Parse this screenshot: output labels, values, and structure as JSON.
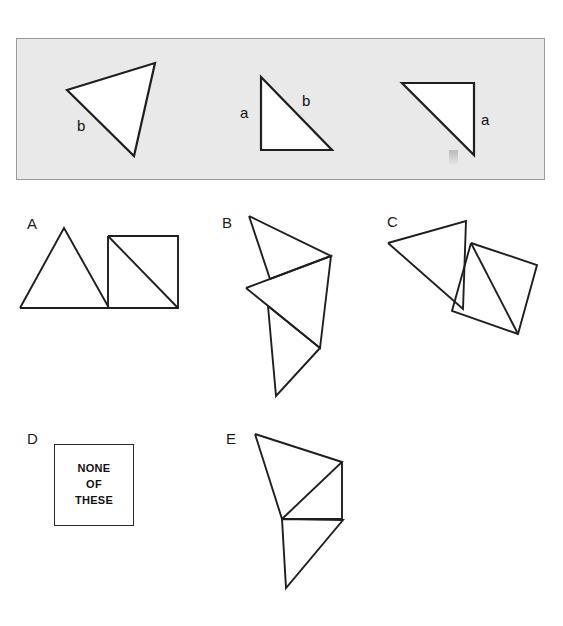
{
  "page": {
    "background_color": "#ffffff",
    "line_color": "#1f1f1f",
    "panel_fill": "#e9e9e9",
    "panel_border": "#9a9a9a"
  },
  "prompt_panel": {
    "name": "given-shapes-panel",
    "shapes": [
      {
        "name": "triangle-scalene-tilted",
        "points": "67,90 155,63 134,156",
        "labels": [
          {
            "text": "b",
            "x": 77,
            "y": 118
          }
        ]
      },
      {
        "name": "triangle-right-legs-left",
        "points": "261,77 261,150 332,150",
        "labels": [
          {
            "text": "a",
            "x": 240,
            "y": 105
          },
          {
            "text": "b",
            "x": 302,
            "y": 93
          }
        ]
      },
      {
        "name": "triangle-right-legs-top",
        "points": "402,83 474,83 474,155",
        "labels": [
          {
            "text": "a",
            "x": 481,
            "y": 112
          }
        ]
      }
    ]
  },
  "options": [
    {
      "id": "A",
      "label": "A",
      "label_x": 27,
      "label_y": 216,
      "name": "option-a",
      "polylines": [
        "20,308 64,228 109,308 20,308",
        "108,236 178,236 178,308 108,308 108,236",
        "108,236 178,308"
      ]
    },
    {
      "id": "B",
      "label": "B",
      "label_x": 222,
      "label_y": 215,
      "name": "option-b",
      "polylines": [
        "249,216 331,256 270,279 249,216",
        "246,288 331,256 320,348 246,288",
        "268,306 320,348 276,396 268,306"
      ]
    },
    {
      "id": "C",
      "label": "C",
      "label_x": 387,
      "label_y": 214,
      "name": "option-c",
      "polylines": [
        "388,243 466,221 463,309 388,243",
        "471,243 537,265 518,334 452,311 471,243",
        "471,243 518,334"
      ]
    },
    {
      "id": "D",
      "label": "D",
      "label_x": 27,
      "label_y": 431,
      "name": "option-d",
      "polylines": []
    },
    {
      "id": "E",
      "label": "E",
      "label_x": 226,
      "label_y": 431,
      "name": "option-e",
      "polylines": [
        "255,434 342,462 282,519 255,434",
        "342,462 342,519 282,519",
        "282,519 343,520 286,588 282,519"
      ]
    }
  ],
  "none_of_these": {
    "name": "none-of-these-box",
    "lines": [
      "NONE",
      "OF",
      "THESE"
    ]
  }
}
